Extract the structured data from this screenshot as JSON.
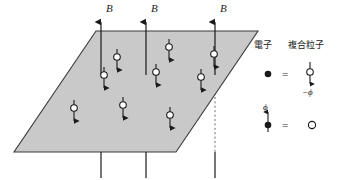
{
  "figure": {
    "title_visible": false,
    "background_color": "#ffffff",
    "plane": {
      "name": "two-dimensional-electron-plane",
      "fill_color": "#c9c9c9",
      "stroke_color": "#3a3a3a",
      "points": "96,31 258,31 176,152 14,152"
    },
    "field_label": "B",
    "field_lines": [
      {
        "x": 101,
        "top": 14,
        "bottom": 178,
        "dash_top": 75,
        "dash_bottom": 152
      },
      {
        "x": 146,
        "top": 14,
        "bottom": 178,
        "dash_top": 75,
        "dash_bottom": 152
      },
      {
        "x": 215,
        "top": 14,
        "bottom": 178,
        "dash_top": 75,
        "dash_bottom": 152
      }
    ],
    "field_label_positions": [
      {
        "x": 106,
        "y": 12
      },
      {
        "x": 151,
        "y": 12
      },
      {
        "x": 220,
        "y": 12
      }
    ],
    "particles": [
      {
        "cx": 117,
        "cy": 57
      },
      {
        "cx": 104,
        "cy": 75
      },
      {
        "cx": 74,
        "cy": 108
      },
      {
        "cx": 123,
        "cy": 105
      },
      {
        "cx": 156,
        "cy": 72
      },
      {
        "cx": 169,
        "cy": 47
      },
      {
        "cx": 170,
        "cy": 115
      },
      {
        "cx": 201,
        "cy": 77
      },
      {
        "cx": 214,
        "cy": 54
      }
    ],
    "legend": {
      "header_left": "電子",
      "header_right": "複合粒子",
      "equals_symbol": "=",
      "row1": {
        "left_symbol": "filled-dot",
        "right_symbol": "flux-attached-electron",
        "flux_label": "−ϕ"
      },
      "row2": {
        "left_symbol": "flux-attached-dot",
        "flux_label": "ϕ",
        "right_symbol": "open-circle"
      }
    },
    "colors": {
      "ink": "#1a1a1a",
      "plane_fill": "#c9c9c9",
      "plane_stroke": "#3a3a3a",
      "dash": "#6e6e6e"
    }
  }
}
